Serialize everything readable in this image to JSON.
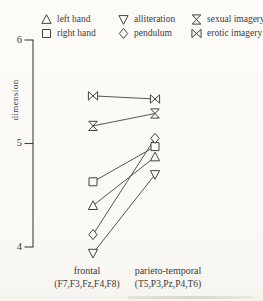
{
  "figure": {
    "paper": "#fcfbf8",
    "ink": "#45413b"
  },
  "axes": {
    "ylabel": "dimension",
    "ytick_labels": [
      "6",
      "5",
      "4"
    ]
  },
  "chart_data": {
    "type": "line",
    "title": "",
    "xlabel": "",
    "ylabel": "dimension",
    "ylim": [
      3.9,
      6.0
    ],
    "yticks": [
      4,
      5,
      6
    ],
    "grid": false,
    "legend_position": "top",
    "categories": [
      "frontal",
      "parieto-temporal"
    ],
    "category_sublabels": [
      "(F7,F3,Fz,F4,F8)",
      "(T5,P3,Pz,P4,T6)"
    ],
    "series": [
      {
        "name": "left hand",
        "marker": "triangle-up",
        "values": [
          4.4,
          4.87
        ]
      },
      {
        "name": "right hand",
        "marker": "square",
        "values": [
          4.63,
          4.97
        ]
      },
      {
        "name": "alliteration",
        "marker": "triangle-down",
        "values": [
          3.94,
          4.7
        ]
      },
      {
        "name": "pendulum",
        "marker": "diamond",
        "values": [
          4.12,
          5.05
        ]
      },
      {
        "name": "sexual imagery",
        "marker": "hourglass",
        "values": [
          5.17,
          5.29
        ]
      },
      {
        "name": "erotic imagery",
        "marker": "bowtie",
        "values": [
          5.46,
          5.43
        ]
      }
    ]
  }
}
